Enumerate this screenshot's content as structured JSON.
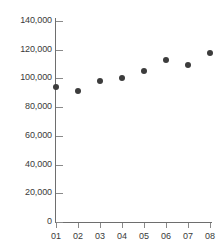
{
  "chart_data": {
    "type": "scatter",
    "title": "",
    "xlabel": "",
    "ylabel": "",
    "categories": [
      "01",
      "02",
      "03",
      "04",
      "05",
      "06",
      "07",
      "08"
    ],
    "values": [
      94000,
      91000,
      98000,
      100000,
      105500,
      112500,
      109500,
      117500
    ],
    "series": [
      {
        "name": "series-1",
        "values": [
          94000,
          91000,
          98000,
          100000,
          105500,
          112500,
          109500,
          117500
        ]
      }
    ],
    "ylim": [
      0,
      140000
    ],
    "ytick_values": [
      0,
      20000,
      40000,
      60000,
      80000,
      100000,
      120000,
      140000
    ],
    "ytick_labels": [
      "0",
      "20,000",
      "40,000",
      "60,000",
      "80,000",
      "100,000",
      "120,000",
      "140,000"
    ],
    "xtick_labels": [
      "01",
      "02",
      "03",
      "04",
      "05",
      "06",
      "07",
      "08"
    ],
    "grid": false,
    "legend": null,
    "marker_color": "#3c3c3c",
    "axis_color": "#6e6e6e",
    "tick_color": "#8a8a8a",
    "label_color": "#3a3a3a",
    "background_color": "#ffffff"
  }
}
